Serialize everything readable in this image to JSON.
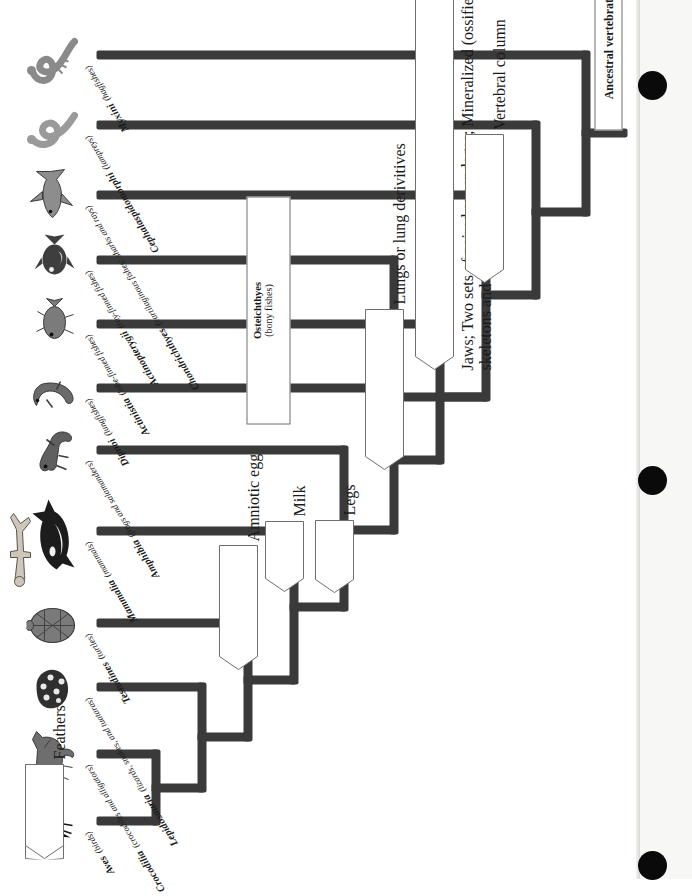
{
  "figure": {
    "kind": "phylogenetic-tree",
    "orientation": "rotated-90-counterclockwise",
    "root_label": "Ancestral vertebrate"
  },
  "taxa": [
    {
      "genus": "Aves",
      "common": "(birds)",
      "silhouette": "bird-silhouette"
    },
    {
      "genus": "Crocodilia",
      "common": "(crocodiles and alligators)",
      "silhouette": "crocodile-silhouette"
    },
    {
      "genus": "Lepidosauria",
      "common": "(lizards, snakes, and tuataras)",
      "silhouette": "snake-silhouette"
    },
    {
      "genus": "Testudines",
      "common": "(turtles)",
      "silhouette": "turtle-silhouette"
    },
    {
      "genus": "Mammalia",
      "common": "(mammals)",
      "silhouette": "whale-silhouette"
    },
    {
      "genus": "Amphibia",
      "common": "(frogs and salamanders)",
      "silhouette": "frog-silhouette"
    },
    {
      "genus": "Dipnoi",
      "common": "(lungfishes)",
      "silhouette": "lungfish-silhouette"
    },
    {
      "genus": "Actinistia",
      "common": "(lobe-finned fishes)",
      "silhouette": "coelacanth-silhouette"
    },
    {
      "genus": "Actinopterygii",
      "common": "(ray-finned fishes)",
      "silhouette": "rayfin-fish-silhouette"
    },
    {
      "genus": "Chondrichthyes",
      "common": "(cartilaginous fishes: sharks and rays)",
      "silhouette": "shark-silhouette"
    },
    {
      "genus": "Cephalaspidomorphi",
      "common": "(lampreys)",
      "silhouette": "lamprey-silhouette"
    },
    {
      "genus": "Myxini",
      "common": "(hagfishes)",
      "silhouette": "hagfish-silhouette"
    }
  ],
  "characters": [
    {
      "id": "feathers",
      "label": "Feathers"
    },
    {
      "id": "amniotic-egg",
      "label": "Amniotic egg"
    },
    {
      "id": "milk",
      "label": "Milk"
    },
    {
      "id": "legs",
      "label": "Legs"
    },
    {
      "id": "lungs",
      "label": "Lungs or lung derivitives"
    },
    {
      "id": "jaws",
      "label": "Jaws; Two sets of paired appendages; Mineralized (ossified) skeletons and teeth"
    },
    {
      "id": "vertebral-column",
      "label": "Vertebral column"
    }
  ],
  "clade_boxes": [
    {
      "id": "osteichthyes",
      "line1": "Osteichthyes",
      "line2": "(bony fishes)"
    }
  ],
  "human_figure": {
    "silhouette": "human-silhouette"
  },
  "colors": {
    "stroke": "#3a3a3a",
    "text": "#1a1a1a",
    "callout_border": "#6e6e6e",
    "paper": "#ffffff",
    "hole": "#0a0a0a"
  },
  "binder_holes": [
    {
      "cx": 653,
      "cy": 85
    },
    {
      "cx": 653,
      "cy": 480
    },
    {
      "cx": 653,
      "cy": 865
    }
  ]
}
